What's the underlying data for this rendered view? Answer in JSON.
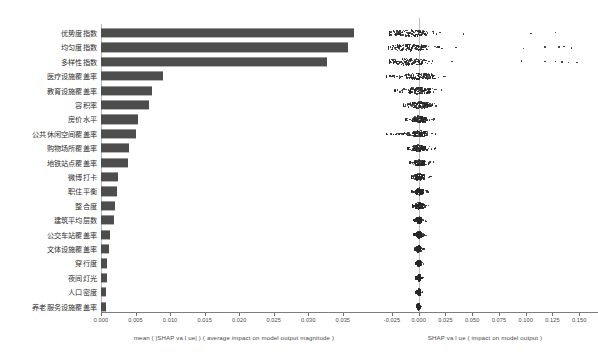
{
  "chart_data": {
    "type": "bar",
    "title": "",
    "panels": [
      {
        "id": "bar",
        "xlabel": "mean ( |SHAP va l ue| ) ( average impact on model output magnitude )",
        "xlim": [
          0.0,
          0.0385
        ],
        "xticks": [
          0.0,
          0.005,
          0.01,
          0.015,
          0.02,
          0.025,
          0.03,
          0.035
        ],
        "xticklabels": [
          "0.000",
          "0.005",
          "0.010",
          "0.015",
          "0.020",
          "0.025",
          "0.030",
          "0.035"
        ],
        "grid": false,
        "bar_color": "#4d4d4d",
        "categories": [
          "优势度指数",
          "均匀度指数",
          "多样性指数",
          "医疗设施覆盖率",
          "教育设施覆盖率",
          "容积率",
          "房价水平",
          "公共休闲空间覆盖率",
          "购物场所覆盖率",
          "地铁站点覆盖率",
          "微博打卡",
          "职住平衡",
          "整合度",
          "建筑平均层数",
          "公交车站覆盖率",
          "文体设施覆盖率",
          "穿行度",
          "夜间灯光",
          "人口密度",
          "养老服务设施覆盖率"
        ],
        "values": [
          0.0366,
          0.0357,
          0.0327,
          0.009,
          0.0074,
          0.007,
          0.0053,
          0.0051,
          0.0041,
          0.0039,
          0.0024,
          0.0023,
          0.002,
          0.0019,
          0.0013,
          0.0011,
          0.0008,
          0.0008,
          0.0007,
          0.0007
        ]
      },
      {
        "id": "beeswarm",
        "type": "beeswarm",
        "xlabel": "SHAP va l ue ( impact on model output )",
        "xlim": [
          -0.038,
          0.162
        ],
        "xticks": [
          -0.025,
          0.0,
          0.025,
          0.05,
          0.075,
          0.1,
          0.125,
          0.15
        ],
        "xticklabels": [
          "-0.025",
          "0.000",
          "0.025",
          "0.050",
          "0.075",
          "0.100",
          "0.125",
          "0.150"
        ],
        "zero_reference": 0.0,
        "dot_color": "#262626",
        "rows": [
          {
            "feature": "优势度指数",
            "spread": [
              -0.027,
              0.02
            ],
            "core": [
              -0.024,
              0.006
            ],
            "outliers": [
              0.042,
              0.105,
              0.128
            ]
          },
          {
            "feature": "均匀度指数",
            "spread": [
              -0.028,
              0.022
            ],
            "core": [
              -0.025,
              0.005
            ],
            "outliers": [
              0.035,
              0.098,
              0.118,
              0.131,
              0.136,
              0.143
            ]
          },
          {
            "feature": "多样性指数",
            "spread": [
              -0.027,
              0.018
            ],
            "core": [
              -0.024,
              0.004
            ],
            "outliers": [
              0.031,
              0.096,
              0.118,
              0.128,
              0.134,
              0.14,
              0.148
            ]
          },
          {
            "feature": "医疗设施覆盖率",
            "spread": [
              -0.03,
              0.026
            ],
            "core": [
              -0.012,
              0.014
            ],
            "outliers": [
              -0.03,
              -0.027
            ]
          },
          {
            "feature": "教育设施覆盖率",
            "spread": [
              -0.022,
              0.024
            ],
            "core": [
              -0.01,
              0.012
            ],
            "outliers": []
          },
          {
            "feature": "容积率",
            "spread": [
              -0.014,
              0.02
            ],
            "core": [
              -0.008,
              0.01
            ],
            "outliers": []
          },
          {
            "feature": "房价水平",
            "spread": [
              -0.012,
              0.015
            ],
            "core": [
              -0.006,
              0.007
            ],
            "outliers": []
          },
          {
            "feature": "公共休闲空间覆盖率",
            "spread": [
              -0.03,
              0.018
            ],
            "core": [
              -0.006,
              0.008
            ],
            "outliers": [
              -0.03,
              -0.026
            ]
          },
          {
            "feature": "购物场所覆盖率",
            "spread": [
              -0.01,
              0.016
            ],
            "core": [
              -0.005,
              0.007
            ],
            "outliers": []
          },
          {
            "feature": "地铁站点覆盖率",
            "spread": [
              -0.008,
              0.014
            ],
            "core": [
              -0.004,
              0.006
            ],
            "outliers": []
          },
          {
            "feature": "微博打卡",
            "spread": [
              -0.007,
              0.012
            ],
            "core": [
              -0.004,
              0.005
            ],
            "outliers": []
          },
          {
            "feature": "职住平衡",
            "spread": [
              -0.007,
              0.01
            ],
            "core": [
              -0.003,
              0.004
            ],
            "outliers": []
          },
          {
            "feature": "整合度",
            "spread": [
              -0.006,
              0.01
            ],
            "core": [
              -0.003,
              0.004
            ],
            "outliers": []
          },
          {
            "feature": "建筑平均层数",
            "spread": [
              -0.005,
              0.007
            ],
            "core": [
              -0.002,
              0.003
            ],
            "outliers": []
          },
          {
            "feature": "公交车站覆盖率",
            "spread": [
              -0.005,
              0.009
            ],
            "core": [
              -0.002,
              0.003
            ],
            "outliers": []
          },
          {
            "feature": "文体设施覆盖率",
            "spread": [
              -0.004,
              0.005
            ],
            "core": [
              -0.002,
              0.002
            ],
            "outliers": []
          },
          {
            "feature": "穿行度",
            "spread": [
              -0.003,
              0.005
            ],
            "core": [
              -0.001,
              0.002
            ],
            "outliers": []
          },
          {
            "feature": "夜间灯光",
            "spread": [
              -0.003,
              0.004
            ],
            "core": [
              -0.001,
              0.002
            ],
            "outliers": []
          },
          {
            "feature": "人口密度",
            "spread": [
              -0.003,
              0.004
            ],
            "core": [
              -0.001,
              0.002
            ],
            "outliers": []
          },
          {
            "feature": "养老服务设施覆盖率",
            "spread": [
              -0.002,
              0.003
            ],
            "core": [
              -0.001,
              0.001
            ],
            "outliers": []
          }
        ]
      }
    ]
  }
}
